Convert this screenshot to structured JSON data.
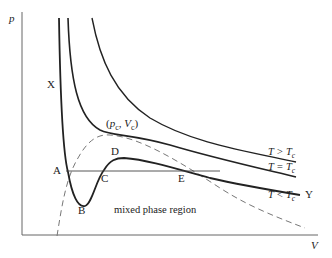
{
  "diagram": {
    "axes": {
      "y_label": "p",
      "x_label": "V"
    },
    "points": {
      "X": "X",
      "A": "A",
      "B": "B",
      "C": "C",
      "D": "D",
      "E": "E",
      "Y": "Y"
    },
    "critical_point_label": "(p_c, V_c)",
    "critical_point": {
      "open": "(",
      "p": "p",
      "p_sub": "c",
      "comma": ", ",
      "v": "V",
      "v_sub": "c",
      "close": ")"
    },
    "region_label": "mixed phase region",
    "isotherms": [
      {
        "name": "T > T_c",
        "T": "T",
        "op": " > ",
        "Tc": "T",
        "sub": "c"
      },
      {
        "name": "T = T_c",
        "T": "T",
        "op": " = ",
        "Tc": "T",
        "sub": "c"
      },
      {
        "name": "T < T_c",
        "T": "T",
        "op": " < ",
        "Tc": "T",
        "sub": "c"
      }
    ],
    "colors": {
      "curve": "#222222",
      "axis": "#555555",
      "dashed": "#777777"
    }
  }
}
